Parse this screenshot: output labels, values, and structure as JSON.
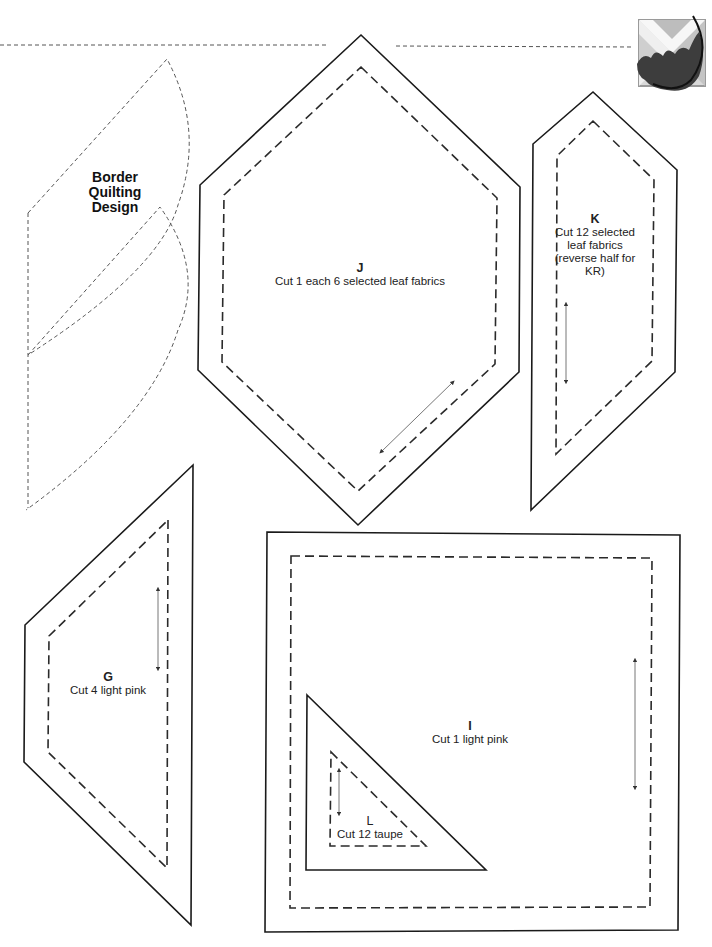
{
  "page": {
    "background": "#ffffff"
  },
  "border_design": {
    "title_lines": [
      "Border",
      "Quilting",
      "Design"
    ]
  },
  "pieces": {
    "J": {
      "letter": "J",
      "instruction": "Cut 1 each 6 selected leaf fabrics"
    },
    "K": {
      "letter": "K",
      "instruction_lines": [
        "Cut 12 selected",
        "leaf fabrics",
        "(reverse half for",
        "KR)"
      ]
    },
    "G": {
      "letter": "G",
      "instruction": "Cut 4 light pink"
    },
    "I": {
      "letter": "I",
      "instruction": "Cut 1 light pink"
    },
    "L": {
      "letter": "L",
      "instruction": "Cut 12 taupe"
    }
  },
  "logo": {
    "icon": "leaf-quilt-block-logo"
  },
  "colors": {
    "line": "#1a1a1a",
    "seam": "#2a2a2a",
    "grain": "#666666"
  }
}
